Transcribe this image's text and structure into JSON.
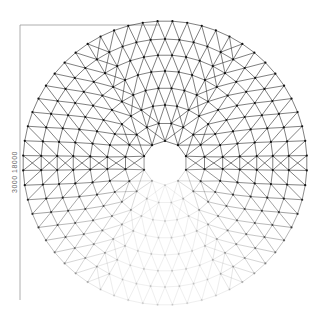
{
  "drawing": {
    "title": "Geodesic dome plan",
    "dimension_text": "3000  18000",
    "center": [
      165,
      163
    ],
    "outer_radius": 142,
    "inner_opening_radius": 22,
    "rings": [
      22,
      40,
      58,
      75,
      92,
      108,
      124,
      142
    ],
    "nodes_per_ring": [
      10,
      20,
      30,
      36,
      42,
      48,
      54,
      60
    ],
    "fade_start_angle_deg": 20,
    "line_color": "#2a2a2a",
    "node_color": "#111111",
    "dimension_line_color": "#888888"
  }
}
